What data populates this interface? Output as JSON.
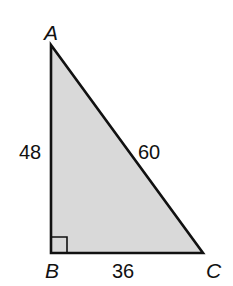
{
  "diagram": {
    "type": "right-triangle",
    "fill_color": "#d9d9d9",
    "stroke_color": "#111111",
    "vertices": {
      "A": {
        "label": "A",
        "x": 51,
        "y": 45
      },
      "B": {
        "label": "B",
        "x": 51,
        "y": 253
      },
      "C": {
        "label": "C",
        "x": 203,
        "y": 253
      }
    },
    "right_angle_at": "B",
    "sides": {
      "AB": {
        "label": "48"
      },
      "AC": {
        "label": "60"
      },
      "BC": {
        "label": "36"
      }
    }
  }
}
